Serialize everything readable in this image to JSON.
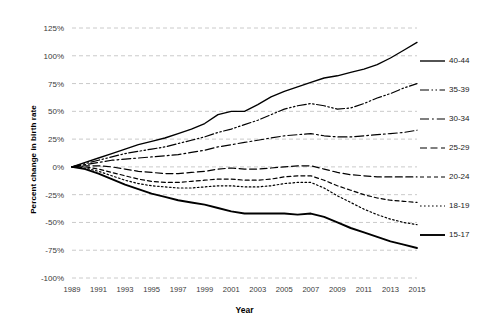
{
  "chart_data": {
    "type": "line",
    "title": "",
    "xlabel": "Year",
    "ylabel": "Percent change in birth rate",
    "xlim": [
      1989,
      2015
    ],
    "ylim": [
      -100,
      125
    ],
    "grid": true,
    "legend_position": "right",
    "x": [
      1989,
      1990,
      1991,
      1992,
      1993,
      1994,
      1995,
      1996,
      1997,
      1998,
      1999,
      2000,
      2001,
      2002,
      2003,
      2004,
      2005,
      2006,
      2007,
      2008,
      2009,
      2010,
      2011,
      2012,
      2013,
      2014,
      2015
    ],
    "xtick_labels": [
      "1989",
      "1991",
      "1993",
      "1995",
      "1997",
      "1999",
      "2001",
      "2003",
      "2005",
      "2007",
      "2009",
      "2011",
      "2013",
      "2015"
    ],
    "ytick_labels": [
      "125%",
      "100%",
      "75%",
      "50%",
      "25%",
      "0%",
      "-25%",
      "-50%",
      "-75%",
      "-100%"
    ],
    "ytick_values": [
      125,
      100,
      75,
      50,
      25,
      0,
      -25,
      -50,
      -75,
      -100
    ],
    "series": [
      {
        "name": "40-44",
        "style": "solid",
        "values": [
          0,
          4,
          8,
          12,
          16,
          20,
          23,
          26,
          30,
          34,
          39,
          47,
          50,
          50,
          56,
          63,
          68,
          72,
          76,
          80,
          82,
          85,
          88,
          92,
          98,
          105,
          112
        ]
      },
      {
        "name": "35-39",
        "style": "dash-dot-dot",
        "values": [
          0,
          3,
          6,
          9,
          12,
          14,
          16,
          18,
          21,
          24,
          27,
          31,
          34,
          38,
          42,
          47,
          52,
          55,
          57,
          55,
          52,
          53,
          57,
          62,
          66,
          71,
          75
        ]
      },
      {
        "name": "30-34",
        "style": "dash-dot",
        "values": [
          0,
          2,
          4,
          6,
          7,
          8,
          9,
          10,
          11,
          13,
          15,
          18,
          20,
          22,
          24,
          26,
          28,
          29,
          30,
          28,
          27,
          27,
          28,
          29,
          30,
          31,
          33
        ]
      },
      {
        "name": "25-29",
        "style": "dashed",
        "values": [
          0,
          1,
          1,
          0,
          -2,
          -4,
          -5,
          -6,
          -6,
          -5,
          -4,
          -2,
          -1,
          -2,
          -2,
          -1,
          0,
          1,
          1,
          -2,
          -5,
          -7,
          -8,
          -9,
          -9,
          -9,
          -9
        ]
      },
      {
        "name": "20-24",
        "style": "short-dash",
        "values": [
          0,
          0,
          -2,
          -5,
          -8,
          -11,
          -13,
          -14,
          -14,
          -13,
          -12,
          -11,
          -11,
          -12,
          -12,
          -11,
          -9,
          -8,
          -8,
          -12,
          -17,
          -21,
          -25,
          -28,
          -30,
          -31,
          -32
        ]
      },
      {
        "name": "18-19",
        "style": "dotted",
        "values": [
          0,
          -1,
          -4,
          -8,
          -12,
          -15,
          -17,
          -18,
          -19,
          -19,
          -18,
          -17,
          -17,
          -18,
          -18,
          -17,
          -15,
          -14,
          -14,
          -19,
          -26,
          -32,
          -38,
          -43,
          -47,
          -50,
          -52
        ]
      },
      {
        "name": "15-17",
        "style": "thick-solid",
        "values": [
          0,
          -2,
          -6,
          -11,
          -16,
          -20,
          -24,
          -27,
          -30,
          -32,
          -34,
          -37,
          -40,
          -42,
          -42,
          -42,
          -42,
          -43,
          -42,
          -45,
          -50,
          -55,
          -59,
          -63,
          -67,
          -70,
          -73
        ]
      }
    ]
  },
  "legend": {
    "entries": [
      {
        "label": "40-44"
      },
      {
        "label": "35-39"
      },
      {
        "label": "30-34"
      },
      {
        "label": "25-29"
      },
      {
        "label": "20-24"
      },
      {
        "label": "18-19"
      },
      {
        "label": "15-17"
      }
    ]
  },
  "colors": {
    "line": "#000000",
    "grid": "#bdbdbd",
    "text": "#1a1a1a",
    "background": "#ffffff"
  }
}
